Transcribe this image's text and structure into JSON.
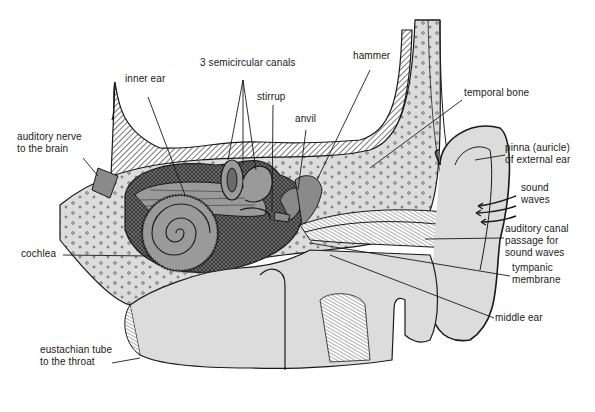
{
  "diagram": {
    "colors": {
      "background": "#ffffff",
      "ink": "#1a1a1a",
      "tissue": "#dcdcdc",
      "tissue_dark": "#a8a8a8",
      "inner_ear": "#9a9a9a"
    },
    "labels": [
      {
        "id": "semicircular-canals",
        "text": "3 semicircular canals",
        "x": 200,
        "y": 64
      },
      {
        "id": "hammer",
        "text": "hammer",
        "x": 353,
        "y": 57
      },
      {
        "id": "inner-ear",
        "text": "inner ear",
        "x": 125,
        "y": 80
      },
      {
        "id": "stirrup",
        "text": "stirrup",
        "x": 257,
        "y": 98
      },
      {
        "id": "temporal-bone",
        "text": "temporal bone",
        "x": 464,
        "y": 94
      },
      {
        "id": "anvil",
        "text": "anvil",
        "x": 295,
        "y": 120
      },
      {
        "id": "auditory-nerve",
        "text": "auditory nerve",
        "x": 17,
        "y": 138
      },
      {
        "id": "auditory-nerve-2",
        "text": "to the brain",
        "x": 17,
        "y": 150
      },
      {
        "id": "pinna",
        "text": "pinna (auricle)",
        "x": 505,
        "y": 149
      },
      {
        "id": "pinna-2",
        "text": "of external ear",
        "x": 505,
        "y": 161
      },
      {
        "id": "sound-waves",
        "text": "sound",
        "x": 521,
        "y": 189
      },
      {
        "id": "sound-waves-2",
        "text": "waves",
        "x": 521,
        "y": 201
      },
      {
        "id": "auditory-canal",
        "text": "auditory canal",
        "x": 505,
        "y": 230
      },
      {
        "id": "auditory-canal-2",
        "text": "passage for",
        "x": 505,
        "y": 242
      },
      {
        "id": "auditory-canal-3",
        "text": "sound waves",
        "x": 505,
        "y": 254
      },
      {
        "id": "cochlea",
        "text": "cochlea",
        "x": 21,
        "y": 248
      },
      {
        "id": "tympanic-membrane",
        "text": "tympanic",
        "x": 512,
        "y": 269
      },
      {
        "id": "tympanic-membrane-2",
        "text": "membrane",
        "x": 512,
        "y": 281
      },
      {
        "id": "middle-ear",
        "text": "middle ear",
        "x": 495,
        "y": 313
      },
      {
        "id": "eustachian-tube",
        "text": "eustachian tube",
        "x": 40,
        "y": 344
      },
      {
        "id": "eustachian-tube-2",
        "text": "to the throat",
        "x": 40,
        "y": 356
      }
    ]
  }
}
